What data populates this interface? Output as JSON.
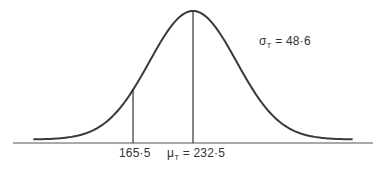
{
  "chart_data": {
    "type": "line",
    "title": "",
    "distribution": "normal",
    "mean": 232.5,
    "sd": 48.6,
    "mean_label": "232·5",
    "mean_symbol": "μ",
    "mean_subscript": "T",
    "sd_symbol": "σ",
    "sd_subscript": "T",
    "sd_label": "48·6",
    "marked_value": 165.5,
    "marked_value_label": "165·5",
    "vertical_lines": [
      165.5,
      232.5
    ],
    "xlabel": "",
    "ylabel": "",
    "grid": false,
    "legend": "none",
    "x_range_sd": [
      -3.67,
      3.67
    ]
  },
  "labels": {
    "sigma_text": "σ",
    "sigma_sub": "T",
    "sigma_eq": " = 48·6",
    "mu_text": "μ",
    "mu_sub": "T",
    "mu_eq": " = 232·5",
    "marked": "165·5"
  },
  "colors": {
    "curve": "#3a3a3a",
    "axis": "#555555",
    "text": "#333333"
  }
}
